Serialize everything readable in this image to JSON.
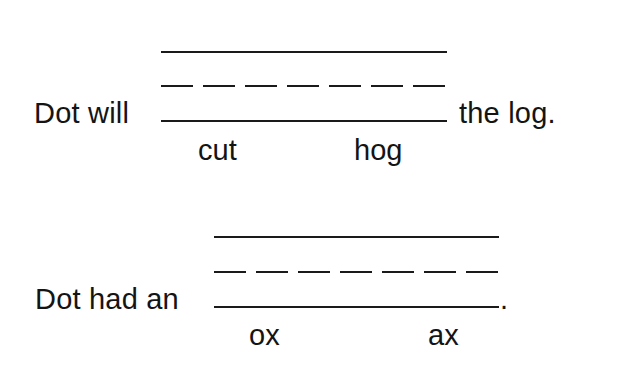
{
  "worksheet": {
    "items": [
      {
        "prefix": "Dot will",
        "suffix": "the log.",
        "choices": [
          "cut",
          "hog"
        ]
      },
      {
        "prefix": "Dot had an",
        "suffix": ".",
        "choices": [
          "ox",
          "ax"
        ]
      }
    ]
  }
}
